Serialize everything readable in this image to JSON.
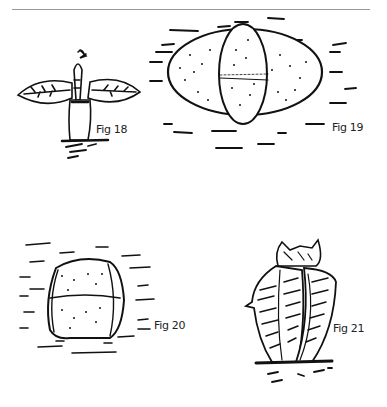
{
  "page": {
    "page_number": "",
    "figures": [
      {
        "id": "fig18",
        "label": "Fig 18",
        "subject": "seedling with two leaves"
      },
      {
        "id": "fig19",
        "label": "Fig 19",
        "subject": "oval body with crossing segment"
      },
      {
        "id": "fig20",
        "label": "Fig 20",
        "subject": "rounded body with divided halves"
      },
      {
        "id": "fig21",
        "label": "Fig 21",
        "subject": "upright striped leaves"
      }
    ]
  },
  "colors": {
    "ink": "#111111",
    "paper": "#ffffff",
    "rule": "#999999"
  }
}
